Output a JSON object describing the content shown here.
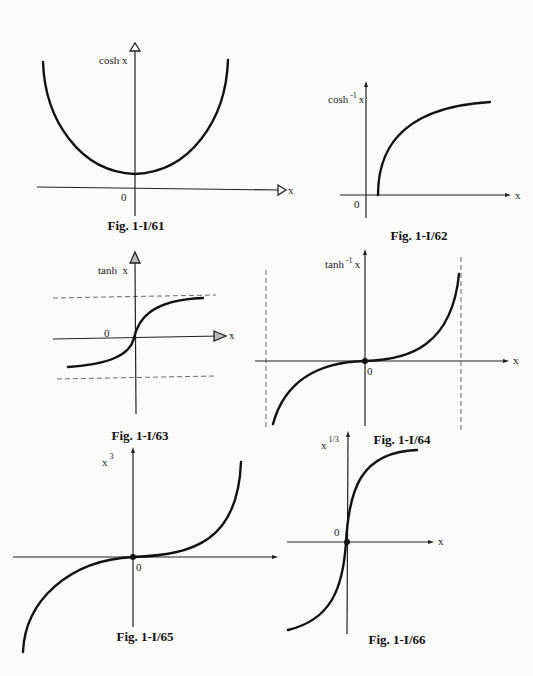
{
  "figures": [
    {
      "id": "fig61",
      "caption": "Fig. 1-I/61",
      "y_label": "cosh x",
      "x_label": "x",
      "origin_label": "0",
      "function": "cosh x",
      "shape": "U-shaped curve, minimum at (0,1)"
    },
    {
      "id": "fig62",
      "caption": "Fig. 1-I/62",
      "y_label_base": "cosh",
      "y_label_sup": "-1",
      "y_label_tail": "x",
      "x_label": "x",
      "origin_label": "0",
      "function": "cosh^-1 x",
      "shape": "starts at x=1 on x-axis, increasing concave"
    },
    {
      "id": "fig63",
      "caption": "Fig. 1-I/63",
      "y_label": "tanh  x",
      "x_label": "x",
      "origin_label": "0",
      "function": "tanh x",
      "shape": "S-curve bounded by dashed asymptotes y=±1"
    },
    {
      "id": "fig64",
      "caption": "Fig. 1-I/64",
      "y_label_base": "tanh",
      "y_label_sup": "-1",
      "y_label_tail": "x",
      "x_label": "x",
      "origin_label": "0",
      "function": "tanh^-1 x",
      "shape": "odd curve with vertical dashed asymptotes x=±1"
    },
    {
      "id": "fig65",
      "caption": "Fig. 1-I/65",
      "y_label_base": "x",
      "y_label_sup": "3",
      "x_label": "x",
      "origin_label": "0",
      "function": "x^3",
      "shape": "cubic through origin"
    },
    {
      "id": "fig66",
      "caption": "Fig. 1-I/66",
      "y_label_base": "x",
      "y_label_sup": "1/3",
      "x_label": "x",
      "origin_label": "0",
      "function": "x^(1/3)",
      "shape": "cube-root curve through origin, vertical tangent at 0"
    }
  ]
}
